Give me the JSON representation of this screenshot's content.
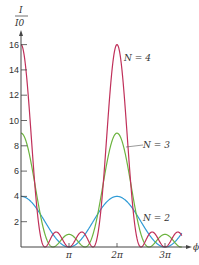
{
  "chart_data": {
    "type": "line",
    "title": "",
    "ylabel": "I / I0",
    "ylabel_num": "I",
    "ylabel_den": "I0",
    "xlabel": "ϕ",
    "yticks": [
      2,
      4,
      6,
      8,
      10,
      12,
      14,
      16
    ],
    "ytick_labels": [
      "2",
      "4",
      "6",
      "8",
      "10",
      "12",
      "14",
      "16"
    ],
    "xticks": [
      "π",
      "2π",
      "3π"
    ],
    "ylim": [
      0,
      17
    ],
    "xlim": [
      0,
      10
    ],
    "series": [
      {
        "name": "N = 4",
        "color": "#c0305a",
        "peak": 16,
        "formula": "sin^2(N phi/2)/sin^2(phi/2)"
      },
      {
        "name": "N = 3",
        "color": "#6cb33f",
        "peak": 9
      },
      {
        "name": "N = 2",
        "color": "#2f9bd6",
        "peak": 4
      }
    ],
    "annotations": [
      "N = 4",
      "N = 3",
      "N = 2"
    ]
  }
}
